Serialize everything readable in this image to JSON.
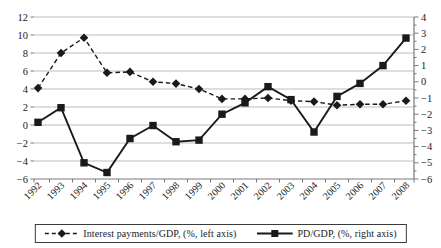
{
  "figure": {
    "background": "#ffffff"
  },
  "chart_data": {
    "type": "line",
    "title": "",
    "categories": [
      "1992",
      "1993",
      "1994",
      "1995",
      "1996",
      "1997",
      "1998",
      "1999",
      "2000",
      "2001",
      "2002",
      "2003",
      "2004",
      "2005",
      "2006",
      "2007",
      "2008"
    ],
    "series": [
      {
        "name": "Interest payments/GDP, (%, left axis)",
        "axis": "left",
        "marker": "diamond",
        "line_style": "dashed",
        "values": [
          4.1,
          8.0,
          9.7,
          5.8,
          5.9,
          4.8,
          4.6,
          4.0,
          2.9,
          2.9,
          3.0,
          2.7,
          2.6,
          2.2,
          2.3,
          2.3,
          2.7
        ]
      },
      {
        "name": "PD/GDP, (%, right axis)",
        "axis": "right",
        "marker": "square",
        "line_style": "solid",
        "values": [
          -2.5,
          -1.6,
          -5.0,
          -5.6,
          -3.5,
          -2.7,
          -3.7,
          -3.6,
          -2.0,
          -1.3,
          -0.3,
          -1.1,
          -3.1,
          -0.9,
          -0.1,
          1.0,
          2.7
        ]
      }
    ],
    "left_axis": {
      "min": -6,
      "max": 12,
      "tick_step": 2,
      "ticks": [
        12,
        10,
        8,
        6,
        4,
        2,
        0,
        -2,
        -4,
        -6
      ]
    },
    "right_axis": {
      "min": -6,
      "max": 4,
      "tick_step": 1,
      "ticks": [
        4,
        3,
        2,
        1,
        0,
        -1,
        -2,
        -3,
        -4,
        -5,
        -6
      ]
    },
    "grid": "horizontal",
    "x_label_rotation": 45,
    "legend": {
      "position": "bottom",
      "bordered": true
    },
    "colors": {
      "series": "#1a1a1a",
      "gridline": "#bdbdbd",
      "axis": "#7a7a7a",
      "text": "#1a1a1a"
    }
  }
}
